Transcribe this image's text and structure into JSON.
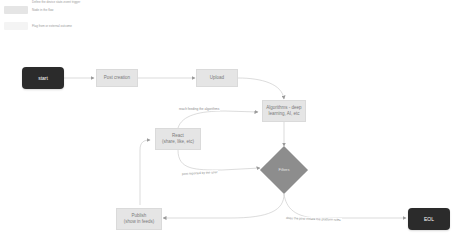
{
  "legend": {
    "items": [
      {
        "label": "Define the device state-event trigger",
        "color": "#ffffff"
      },
      {
        "label": "Node in the flow",
        "color": "#e5e5e5"
      },
      {
        "label": "Flag from or external outcome",
        "color": "#f4f4f4"
      }
    ]
  },
  "nodes": {
    "start": {
      "label": "start",
      "type": "terminal",
      "color": "#2b2b2b"
    },
    "post_creation": {
      "label": "Post creation",
      "type": "process"
    },
    "upload": {
      "label": "Upload",
      "type": "process"
    },
    "algorithms": {
      "label_line1": "Algorithms - deep",
      "label_line2": "learning, AI, etc",
      "type": "process"
    },
    "react": {
      "label_line1": "React",
      "label_line2": "(share, like, etc)",
      "type": "process"
    },
    "filters": {
      "label": "Filters",
      "type": "decision",
      "color": "#8d8d8d"
    },
    "publish": {
      "label_line1": "Publish",
      "label_line2": "(show in feeds)",
      "type": "process"
    },
    "eol": {
      "label": "EOL",
      "type": "terminal",
      "color": "#2b2b2b"
    }
  },
  "edges": [
    {
      "from": "start",
      "to": "post_creation",
      "label": ""
    },
    {
      "from": "post_creation",
      "to": "upload",
      "label": ""
    },
    {
      "from": "upload",
      "to": "algorithms",
      "label": ""
    },
    {
      "from": "react",
      "to": "algorithms",
      "label": "reach feeding the algorithms"
    },
    {
      "from": "algorithms",
      "to": "filters",
      "label": ""
    },
    {
      "from": "react",
      "to": "filters",
      "label": "post reported by the user"
    },
    {
      "from": "filters",
      "to": "publish",
      "label": ""
    },
    {
      "from": "publish",
      "to": "react",
      "label": ""
    },
    {
      "from": "filters",
      "to": "eol",
      "label": "does the post violate the platform rules"
    }
  ],
  "edge_labels": {
    "reach": "reach feeding the algorithms",
    "reported": "post reported by the user",
    "violate": "does the post violate the platform rules"
  }
}
